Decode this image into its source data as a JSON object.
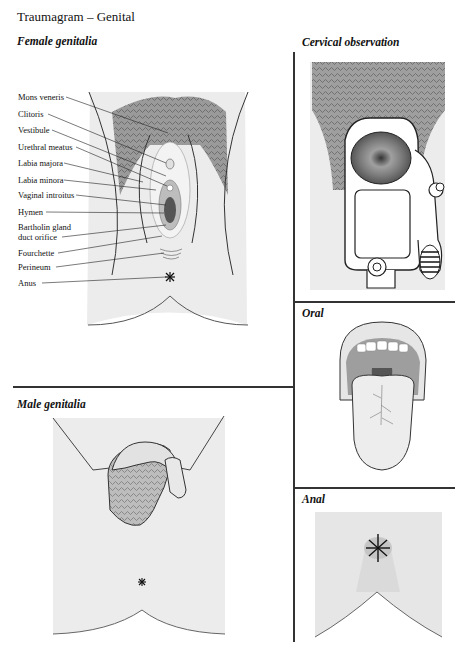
{
  "page": {
    "title": "Traumagram – Genital"
  },
  "sections": {
    "female": {
      "title": "Female genitalia",
      "labels": [
        {
          "text": "Mons veneris",
          "y": 96
        },
        {
          "text": "Clitoris",
          "y": 113
        },
        {
          "text": "Vestibule",
          "y": 129
        },
        {
          "text": "Urethral meatus",
          "y": 146
        },
        {
          "text": "Labia majora",
          "y": 162
        },
        {
          "text": "Labia minora",
          "y": 179
        },
        {
          "text": "Vaginal introitus",
          "y": 194
        },
        {
          "text": "Hymen",
          "y": 211
        },
        {
          "text": "Bartholin gland",
          "y": 226
        },
        {
          "text": "duct orifice",
          "y": 236
        },
        {
          "text": "Fourchette",
          "y": 252
        },
        {
          "text": "Perineum",
          "y": 266
        },
        {
          "text": "Anus",
          "y": 282
        }
      ]
    },
    "cervical": {
      "title": "Cervical observation"
    },
    "oral": {
      "title": "Oral"
    },
    "male": {
      "title": "Male genitalia"
    },
    "anal": {
      "title": "Anal"
    }
  },
  "colors": {
    "line": "#333333",
    "skin_light": "#ececec",
    "skin_mid": "#d6d6d6",
    "hair": "#8a8a8a",
    "tissue_dark": "#6e6e6e"
  }
}
